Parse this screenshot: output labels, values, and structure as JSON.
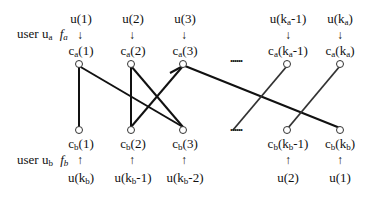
{
  "top_user": {
    "label": "user u",
    "sub": "a",
    "func": "f",
    "func_sub": "a"
  },
  "bottom_user": {
    "label": "user u",
    "sub": "b",
    "func": "f",
    "func_sub": "b"
  },
  "top_inputs": [
    {
      "pre": "u(1)",
      "sub": "",
      "post": ""
    },
    {
      "pre": "u(2)",
      "sub": "",
      "post": ""
    },
    {
      "pre": "u(3)",
      "sub": "",
      "post": ""
    },
    {
      "pre": "u(k",
      "sub": "a",
      "post": "-1)"
    },
    {
      "pre": "u(k",
      "sub": "a",
      "post": ")"
    }
  ],
  "top_nodes": [
    {
      "pre": "c",
      "sub": "a",
      "post": "(1)"
    },
    {
      "pre": "c",
      "sub": "a",
      "post": "(2)"
    },
    {
      "pre": "c",
      "sub": "a",
      "post": "(3)"
    },
    {
      "pre": "c",
      "sub": "a",
      "post": "(k",
      "sub2": "a",
      "post2": "-1)"
    },
    {
      "pre": "c",
      "sub": "a",
      "post": "(k",
      "sub2": "a",
      "post2": ")"
    }
  ],
  "bottom_nodes": [
    {
      "pre": "c",
      "sub": "b",
      "post": "(1)"
    },
    {
      "pre": "c",
      "sub": "b",
      "post": "(2)"
    },
    {
      "pre": "c",
      "sub": "b",
      "post": "(3)"
    },
    {
      "pre": "c",
      "sub": "b",
      "post": "(k",
      "sub2": "b",
      "post2": "-1)"
    },
    {
      "pre": "c",
      "sub": "b",
      "post": "(k",
      "sub2": "b",
      "post2": ")"
    }
  ],
  "bottom_inputs": [
    {
      "pre": "u(k",
      "sub": "b",
      "post": ")"
    },
    {
      "pre": "u(k",
      "sub": "b",
      "post": "-1)"
    },
    {
      "pre": "u(k",
      "sub": "b",
      "post": "-2)"
    },
    {
      "pre": "u(2)",
      "sub": "",
      "post": ""
    },
    {
      "pre": "u(1)",
      "sub": "",
      "post": ""
    }
  ],
  "ellipsis": "......",
  "arrow_down": "↓",
  "arrow_up": "↑",
  "edges": [
    {
      "from": "ca(1)",
      "to": "cb(1)"
    },
    {
      "from": "ca(1)",
      "to": "cb(3)"
    },
    {
      "from": "ca(2)",
      "to": "cb(2)"
    },
    {
      "from": "ca(2)",
      "to": "cb(3)"
    },
    {
      "from": "ca(3)",
      "to": "cb(2)"
    },
    {
      "from": "ca(3)",
      "to": "cb(kb)"
    },
    {
      "from": "ca(ka-1)",
      "to": "cb(...)"
    },
    {
      "from": "ca(ka)",
      "to": "cb(kb-1)"
    }
  ]
}
